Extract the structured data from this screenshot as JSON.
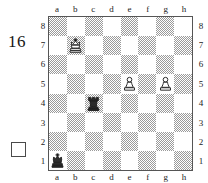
{
  "diagram": {
    "number": "16",
    "side_to_move_marker": "white-square",
    "side_to_move": "white"
  },
  "board": {
    "files": [
      "a",
      "b",
      "c",
      "d",
      "e",
      "f",
      "g",
      "h"
    ],
    "ranks": [
      "8",
      "7",
      "6",
      "5",
      "4",
      "3",
      "2",
      "1"
    ],
    "light_square_color": "#ffffff",
    "dark_square_color": "#9a9a9a",
    "border_color": "#555555",
    "pieces": [
      {
        "square": "b7",
        "piece": "white-king",
        "color": "white",
        "type": "king",
        "file": 1,
        "rank": 7
      },
      {
        "square": "e5",
        "piece": "white-pawn",
        "color": "white",
        "type": "pawn",
        "file": 4,
        "rank": 5
      },
      {
        "square": "g5",
        "piece": "white-pawn",
        "color": "white",
        "type": "pawn",
        "file": 6,
        "rank": 5
      },
      {
        "square": "c4",
        "piece": "black-rook",
        "color": "black",
        "type": "rook",
        "file": 2,
        "rank": 4
      },
      {
        "square": "a1",
        "piece": "black-king",
        "color": "black",
        "type": "king",
        "file": 0,
        "rank": 1
      }
    ]
  }
}
